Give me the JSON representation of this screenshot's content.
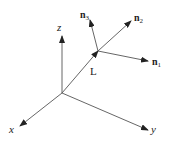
{
  "diagram": {
    "type": "3d-coordinate-frame",
    "axes": {
      "x": {
        "label": "x"
      },
      "y": {
        "label": "y"
      },
      "z": {
        "label": "z"
      }
    },
    "vector": {
      "label": "L"
    },
    "local_frame": {
      "n1": {
        "base": "n",
        "sub": "1"
      },
      "n2": {
        "base": "n",
        "sub": "2"
      },
      "n3": {
        "base": "n",
        "sub": "3"
      }
    },
    "colors": {
      "line": "#444444",
      "text": "#222222",
      "background": "#ffffff"
    }
  }
}
